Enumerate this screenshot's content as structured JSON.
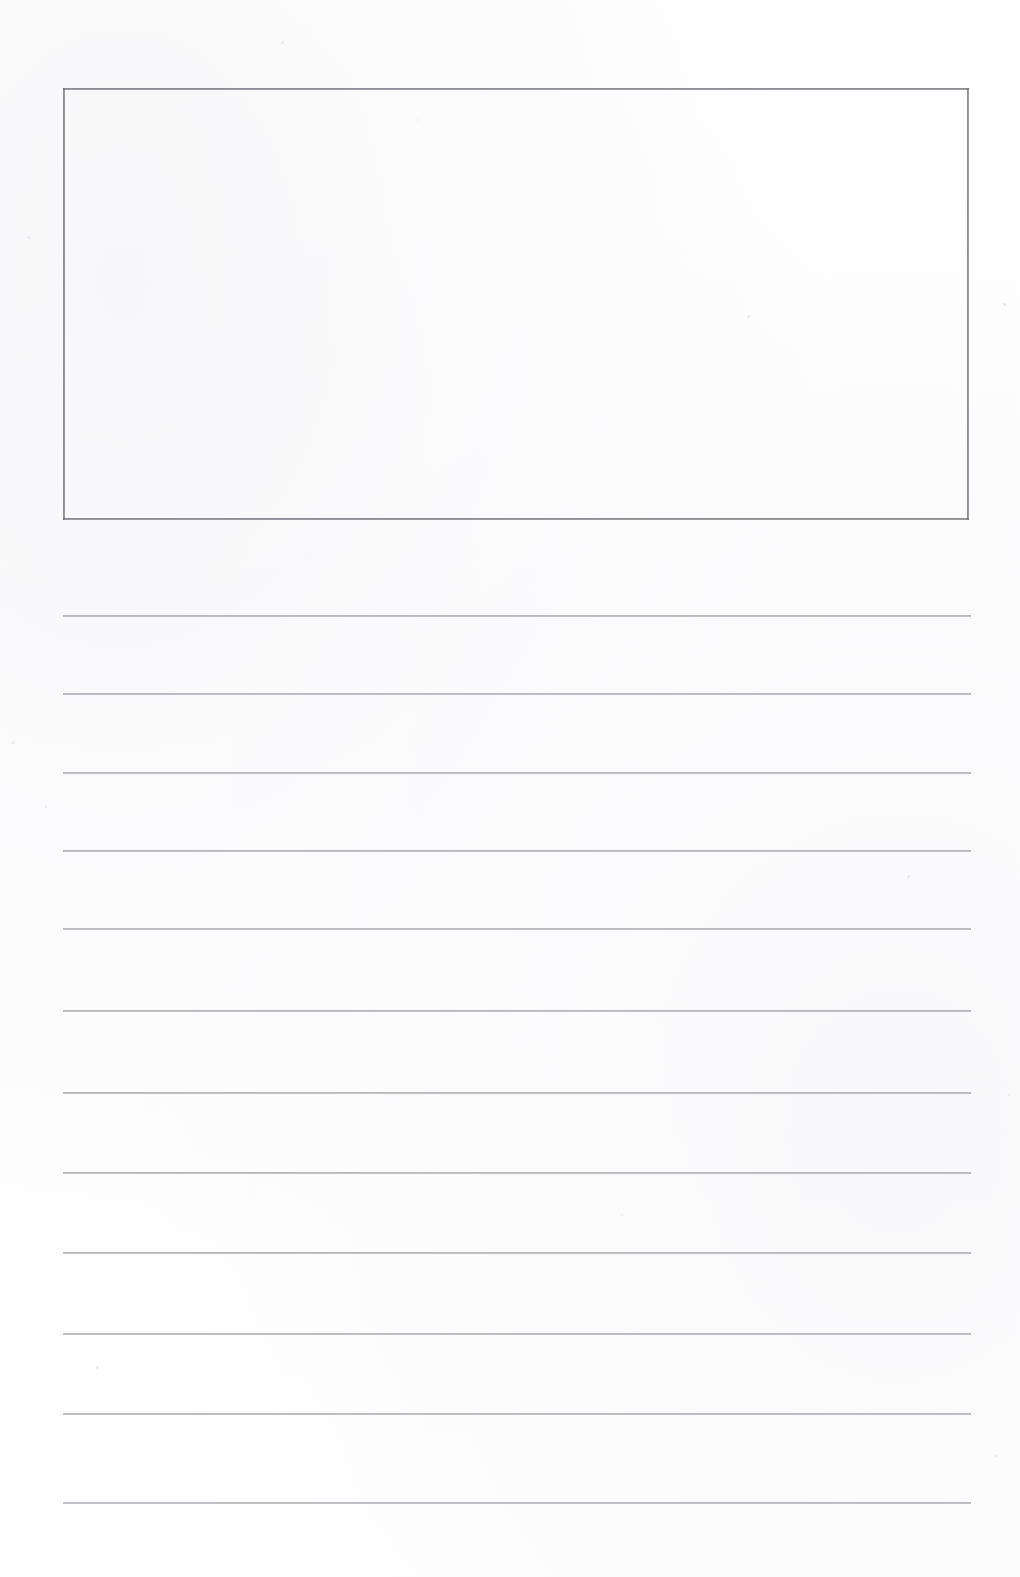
{
  "page": {
    "kind": "scanned-blank-journal-worksheet",
    "width": 1020,
    "height": 1577,
    "background_color": "#ffffff",
    "paper_color": "#fefefe",
    "content_text": "",
    "has_printed_text": false
  },
  "drawing_box": {
    "name": "drawing-area",
    "content_text": "",
    "is_empty": true,
    "border_color": "#6b6b73",
    "border_width_px": 2,
    "x": 63,
    "y": 88,
    "width": 906,
    "height": 432
  },
  "writing_area": {
    "name": "ruled-writing-area",
    "line_color": "#a0a0a8",
    "line_thickness_px": 2,
    "line_left_x": 63,
    "line_right_x": 971,
    "line_count": 12,
    "lines": [
      {
        "index": 1,
        "y": 615,
        "text": ""
      },
      {
        "index": 2,
        "y": 693,
        "text": ""
      },
      {
        "index": 3,
        "y": 772,
        "text": ""
      },
      {
        "index": 4,
        "y": 850,
        "text": ""
      },
      {
        "index": 5,
        "y": 928,
        "text": ""
      },
      {
        "index": 6,
        "y": 1010,
        "text": ""
      },
      {
        "index": 7,
        "y": 1092,
        "text": ""
      },
      {
        "index": 8,
        "y": 1172,
        "text": ""
      },
      {
        "index": 9,
        "y": 1252,
        "text": ""
      },
      {
        "index": 10,
        "y": 1333,
        "text": ""
      },
      {
        "index": 11,
        "y": 1413,
        "text": ""
      },
      {
        "index": 12,
        "y": 1502,
        "text": ""
      }
    ]
  },
  "scan_artifacts": {
    "name": "scanner-speckles",
    "specks": [
      {
        "x": 281,
        "y": 41,
        "size": 3
      },
      {
        "x": 27,
        "y": 236,
        "size": 3
      },
      {
        "x": 747,
        "y": 315,
        "size": 3
      },
      {
        "x": 1003,
        "y": 303,
        "size": 3
      },
      {
        "x": 417,
        "y": 119,
        "size": 2
      },
      {
        "x": 11,
        "y": 741,
        "size": 3
      },
      {
        "x": 907,
        "y": 875,
        "size": 3
      },
      {
        "x": 96,
        "y": 1366,
        "size": 3
      },
      {
        "x": 621,
        "y": 1214,
        "size": 2
      },
      {
        "x": 1008,
        "y": 1094,
        "size": 2
      },
      {
        "x": 45,
        "y": 806,
        "size": 2
      },
      {
        "x": 995,
        "y": 1455,
        "size": 2
      }
    ]
  }
}
